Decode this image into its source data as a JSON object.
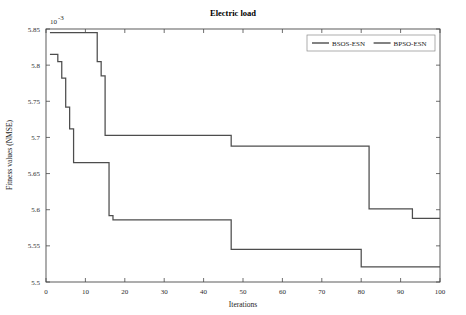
{
  "chart_data": {
    "type": "line",
    "title": "Electric load",
    "xlabel": "Iterations",
    "ylabel": "Fitness values (NMSE)",
    "y_multiplier": "10",
    "y_exponent": "-3",
    "xlim": [
      0,
      100
    ],
    "ylim": [
      5.5,
      5.85
    ],
    "xticks": [
      0,
      10,
      20,
      30,
      40,
      50,
      60,
      70,
      80,
      90,
      100
    ],
    "xticklabels": [
      "0",
      "10",
      "20",
      "30",
      "40",
      "50",
      "60",
      "70",
      "80",
      "90",
      "100"
    ],
    "yticks": [
      5.5,
      5.55,
      5.6,
      5.65,
      5.7,
      5.75,
      5.8,
      5.85
    ],
    "yticklabels": [
      "5.5",
      "5.55",
      "5.6",
      "5.65",
      "5.7",
      "5.75",
      "5.8",
      "5.85"
    ],
    "grid": false,
    "legend_position": "top-right",
    "series": [
      {
        "name": "BSOS-ESN",
        "color": "#4d4d4d",
        "step": "post",
        "x": [
          1,
          2,
          3,
          4,
          5,
          6,
          7,
          8,
          9,
          10,
          11,
          15,
          16,
          17,
          46,
          47,
          79,
          80,
          100
        ],
        "y": [
          5.815,
          5.815,
          5.805,
          5.782,
          5.742,
          5.712,
          5.665,
          5.665,
          5.665,
          5.665,
          5.665,
          5.665,
          5.592,
          5.586,
          5.586,
          5.545,
          5.545,
          5.521,
          5.521
        ]
      },
      {
        "name": "BPSO-ESN",
        "color": "#4d4d4d",
        "step": "post",
        "x": [
          1,
          2,
          3,
          4,
          5,
          6,
          7,
          8,
          9,
          12,
          13,
          14,
          15,
          46,
          47,
          81,
          82,
          92,
          93,
          100
        ],
        "y": [
          5.845,
          5.845,
          5.845,
          5.845,
          5.845,
          5.845,
          5.845,
          5.845,
          5.845,
          5.845,
          5.805,
          5.785,
          5.703,
          5.703,
          5.688,
          5.688,
          5.601,
          5.601,
          5.588,
          5.588
        ]
      }
    ],
    "legend": [
      {
        "label": "BSOS-ESN",
        "color": "#4d4d4d"
      },
      {
        "label": "BPSO-ESN",
        "color": "#4d4d4d"
      }
    ]
  }
}
